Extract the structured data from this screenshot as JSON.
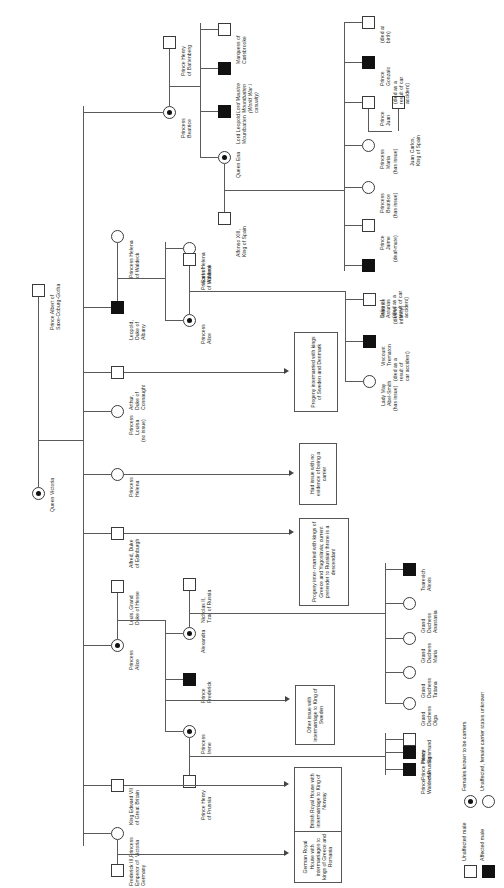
{
  "chart_title": "Pedigree of haemophilia in the descendants of Queen Victoria",
  "founders": {
    "queen_victoria": "Queen Victoria",
    "prince_albert": "Prince Albert of\nSaxe-Coburg-Gotha"
  },
  "legend": {
    "items": [
      {
        "symbol": "square-open",
        "label": "Unaffected male"
      },
      {
        "symbol": "square-filled",
        "label": "Affected male"
      },
      {
        "symbol": "circle-dot",
        "label": "Females known to be carriers"
      },
      {
        "symbol": "circle-open",
        "label": "Unaffected, female carrier status unknown"
      }
    ]
  },
  "people": {
    "prince_henry_battenberg": "Prince Henry\nof Battenberg",
    "princess_beatrice": "Princess\nBeatrice",
    "lord_leopold_mountbatten": "Lord Leopold\nMountbatten",
    "lord_maurice_mountbatten": "Lord Maurice\nMountbatten\n(World War I\ncasualty)",
    "marquess_carisbrooke": "Marquess of\nCarisbrooke",
    "queen_ena": "Queen Ena",
    "alfonso_xiii": "Alfonso XIII,\nKing of Spain",
    "duke_of_asturias": "Duke of\nAsturias\n(died as a\nresult of car\naccident)",
    "prince_jaime": "Prince\nJaime",
    "prince_jaime_note": "(deaf-mute)",
    "princess_beatrice_sp": "Princess\nBeatrice",
    "princess_beatrice_sp_note": "(has issue)",
    "princess_maria": "Princess\nMaria",
    "princess_maria_note": "(has issue)",
    "prince_juan": "Prince\nJuan",
    "juan_carlos": "Juan Carlos,\nKing of Spain",
    "prince_gonzalo": "Prince\nGonzalo",
    "prince_gonzalo_note": "(died as a\nresult of car\naccident)",
    "died_at_birth": "(died at\nbirth)",
    "princess_helena_waldeck": "Princess Helena\nof Waldeck",
    "leopold_duke_albany": "Leopold,\nDuke of\nAlbany",
    "earl_of_athlone": "Earl of\nAthlone",
    "princess_alice_albany": "Princess\nAlice",
    "lady_may_abel_smith": "Lady May\nAbel-Smith",
    "lady_may_note": "(has issue)",
    "viscount_trematon": "Viscount\nTrematon",
    "viscount_trematon_note": "(died as a\nresult of\ncar accident)",
    "maurice": "Maurice",
    "maurice_note": "(died in\ninfancy)",
    "arthur_duke_connaught": "Arthur,\nDuke of\nConnaught",
    "princess_louisa": "Princess\nLouisa",
    "princess_louisa_note": "(no issue)",
    "princess_helena": "Princess\nHelena",
    "alfred_duke_edinburgh": "Alfred, Duke\nof Edinburgh",
    "princess_alice_hesse": "Princess\nAlice",
    "louis_grand_duke_hesse": "Louis, Grand\nDuke of Hesse",
    "alexandra": "Alexandra",
    "nicholas_ii": "Nicholas II,\nTzar of Russia",
    "tsarevich_alexis": "Tsarevich\nAlexis",
    "grand_duchess_olga": "Grand\nDuchess\nOlga",
    "grand_duchess_tatiana": "Grand\nDuchess\nTatiana",
    "grand_duchess_maria": "Grand\nDuchess\nMaria",
    "grand_duchess_anastasia": "Grand\nDuchess\nAnastasia",
    "prince_frederick": "Prince\nFrederick",
    "princess_irene": "Princess\nIrene",
    "prince_henry_prussia": "Prince Henry\nof Prussia",
    "prince_waldemar": "Prince\nWaldemar",
    "prince_sigismund": "Prince\nSigismund",
    "king_edward_vii": "King Edward VII\nof Great Britain",
    "princess_victoria": "Princess\nVictoria",
    "frederick_iii": "Frederick III,\nEmperor of\nGermany"
  },
  "notes": {
    "sweden_denmark": "Progeny intermarried\nwith kings of Sweden\nand Denmark",
    "no_evidence_carrier": "Had issue\nwith no\nevidence\nof being\na carrier",
    "greece_yugoslavia": "Progeny inter-\nmarried with\nkings of Greece\nand Yugoslavia;\ncurrent pretender\nto Russian throne\nis a descendant",
    "king_of_sweden": "Other issue with\nintermarriage to\nKing of Sweden",
    "king_of_norway": "British Royal House\nwith intermarriage\nto King of Norway",
    "greece_romania": "German Royal\nHouse with\nintermarriages\nto kings of\nGreece and\nRomania"
  }
}
